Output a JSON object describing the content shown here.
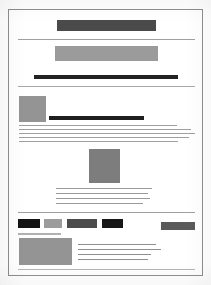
{
  "document": {
    "kind": "scanned-page-thumbnail",
    "page_background": "#ffffff",
    "page_border_color": "#8e8e8e",
    "canvas": {
      "width": 211,
      "height": 285
    },
    "paper": {
      "x": 8,
      "y": 9,
      "width": 195,
      "height": 267
    }
  },
  "palette": {
    "ink_black": "#1c1c1c",
    "ink_dark": "#3d3d3d",
    "ink_mid": "#555555",
    "ink_gray": "#7b7b7b",
    "ink_light": "#9a9a9a",
    "rule_line": "#9d9d9d",
    "rule_faint": "#b4b4b4"
  },
  "blocks": [
    {
      "id": "title-banner",
      "name": "redacted-title-block",
      "role": "heading",
      "x": 56,
      "y": 19,
      "w": 99,
      "h": 11,
      "color": "#4a4a4a"
    },
    {
      "id": "rule-under-title",
      "name": "horizontal-rule",
      "role": "divider",
      "x": 17,
      "y": 38,
      "w": 177,
      "h": 1,
      "color": "#a0a0a0"
    },
    {
      "id": "subtitle-banner",
      "name": "redacted-subtitle-block",
      "role": "subheading",
      "x": 54,
      "y": 45,
      "w": 103,
      "h": 15,
      "color": "#9b9b9b"
    },
    {
      "id": "emphasis-bar",
      "name": "redacted-emphasis-bar",
      "role": "rule-heavy",
      "x": 33,
      "y": 74,
      "w": 144,
      "h": 4,
      "color": "#232323"
    },
    {
      "id": "rule-under-emphasis",
      "name": "horizontal-rule",
      "role": "divider",
      "x": 17,
      "y": 85,
      "w": 177,
      "h": 1,
      "color": "#a8a8a8"
    },
    {
      "id": "figure-left",
      "name": "image-placeholder-left",
      "role": "figure",
      "x": 18,
      "y": 95,
      "w": 27,
      "h": 26,
      "color": "#949494"
    },
    {
      "id": "caption-bar",
      "name": "redacted-caption-bar",
      "role": "rule-heavy",
      "x": 48,
      "y": 115,
      "w": 95,
      "h": 4,
      "color": "#1f1f1f"
    },
    {
      "id": "para-1",
      "name": "text-line-group",
      "role": "paragraph",
      "x": 18,
      "y": 124,
      "line_height": 4,
      "thickness": 1,
      "color": "#9f9f9f",
      "line_widths": [
        158,
        172,
        176,
        170,
        159
      ]
    },
    {
      "id": "figure-center",
      "name": "image-placeholder-center",
      "role": "figure",
      "x": 88,
      "y": 148,
      "w": 31,
      "h": 34,
      "color": "#7d7d7d"
    },
    {
      "id": "para-2",
      "name": "text-line-group",
      "role": "paragraph",
      "x": 55,
      "y": 187,
      "line_height": 5,
      "thickness": 1,
      "color": "#9a9a9a",
      "line_widths": [
        96,
        92,
        94,
        87
      ]
    },
    {
      "id": "rule-above-chips",
      "name": "horizontal-rule",
      "role": "divider",
      "x": 17,
      "y": 211,
      "w": 177,
      "h": 1,
      "color": "#a0a0a0"
    },
    {
      "id": "chip-1",
      "name": "redacted-chip",
      "role": "chip",
      "x": 17,
      "y": 218,
      "w": 22,
      "h": 9,
      "color": "#141414"
    },
    {
      "id": "chip-2",
      "name": "redacted-chip",
      "role": "chip",
      "x": 43,
      "y": 218,
      "w": 18,
      "h": 9,
      "color": "#9c9c9c"
    },
    {
      "id": "chip-3",
      "name": "redacted-chip",
      "role": "chip",
      "x": 66,
      "y": 218,
      "w": 30,
      "h": 9,
      "color": "#4c4c4c"
    },
    {
      "id": "chip-4",
      "name": "redacted-chip",
      "role": "chip",
      "x": 101,
      "y": 218,
      "w": 21,
      "h": 9,
      "color": "#171717"
    },
    {
      "id": "chip-5",
      "name": "redacted-chip",
      "role": "chip",
      "x": 160,
      "y": 221,
      "w": 34,
      "h": 8,
      "color": "#5a5a5a"
    },
    {
      "id": "rule-under-chips",
      "name": "horizontal-rule",
      "role": "divider",
      "x": 17,
      "y": 232,
      "w": 43,
      "h": 2,
      "color": "#b1b1b1"
    },
    {
      "id": "figure-bottom-left",
      "name": "image-placeholder-bottom",
      "role": "figure",
      "x": 18,
      "y": 237,
      "w": 53,
      "h": 27,
      "color": "#949494"
    },
    {
      "id": "para-3",
      "name": "text-line-group",
      "role": "paragraph",
      "x": 77,
      "y": 243,
      "line_height": 5,
      "thickness": 1,
      "color": "#8f8f8f",
      "line_widths": [
        78,
        83,
        73,
        70
      ]
    },
    {
      "id": "rule-footer",
      "name": "horizontal-rule",
      "role": "divider",
      "x": 17,
      "y": 268,
      "w": 177,
      "h": 1,
      "color": "#b6b6b6"
    }
  ]
}
